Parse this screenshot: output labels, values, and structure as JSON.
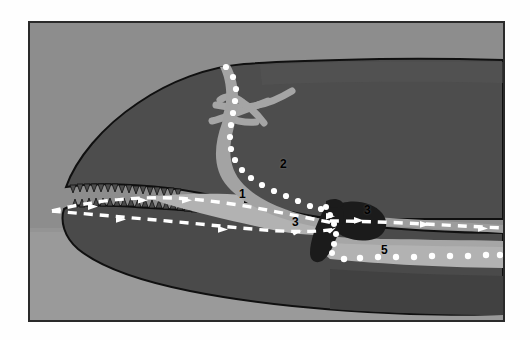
{
  "figure": {
    "frame": {
      "border_color": "#2a2a2a",
      "page_background": "#fefefe"
    },
    "palette": {
      "background_upper": "#8e8e8e",
      "background_lower": "#9a9a9a",
      "tissue_dark": "#4b4b4b",
      "tissue_mid": "#5a5a5a",
      "cavity_light": "#b4b4b4",
      "duct_light": "#a8a8a8",
      "gland_black": "#1a1a1a",
      "outline_black": "#111111",
      "marker_white": "#ffffff",
      "label_black": "#000000"
    },
    "labels": [
      {
        "id": "label-1",
        "text": "1",
        "x": 209,
        "y": 171
      },
      {
        "id": "label-2",
        "text": "2",
        "x": 250,
        "y": 141
      },
      {
        "id": "label-3a",
        "text": "3",
        "x": 292,
        "y": 199
      },
      {
        "id": "label-3b",
        "text": "3",
        "x": 362,
        "y": 187
      },
      {
        "id": "label-5",
        "text": "5",
        "x": 379,
        "y": 227
      }
    ],
    "annotations": {
      "dashed_arrow_path_upper": "airflow path entering mouth toward throat",
      "dashed_arrow_path_lower": "secondary airflow path along lower jaw",
      "dotted_path_nasal": "dotted trace descending from nasal region",
      "dotted_path_ventral": "dotted trace along ventral light band"
    }
  }
}
